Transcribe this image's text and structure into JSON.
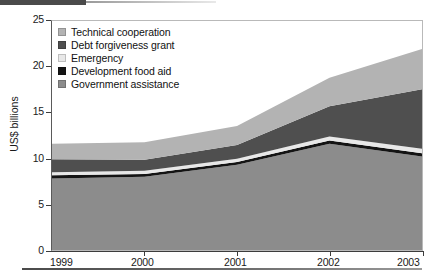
{
  "figure": {
    "top_rule": "decorative-rule",
    "bottom_rule": "decorative-rule"
  },
  "chart_data": {
    "type": "area",
    "stacked": true,
    "title": "",
    "xlabel": "",
    "ylabel": "US$ billions",
    "x": [
      "1999",
      "2000",
      "2001",
      "2002",
      "2003"
    ],
    "categories": [
      "1999",
      "2000",
      "2001",
      "2002",
      "2003"
    ],
    "xtick_labels": [
      "1999",
      "2000",
      "2001",
      "2002",
      "2003"
    ],
    "ytick_labels": [
      "0",
      "5",
      "10",
      "15",
      "20",
      "25"
    ],
    "ytick_values": [
      0,
      5,
      10,
      15,
      20,
      25
    ],
    "ylim": [
      0,
      25
    ],
    "grid": false,
    "legend_position": "top-left",
    "stack_order_bottom_to_top": [
      "Government assistance",
      "Development food aid",
      "Emergency",
      "Debt forgiveness grant",
      "Technical cooperation"
    ],
    "series": [
      {
        "name": "Government assistance",
        "color": "#8c8c8c",
        "values": [
          7.8,
          8.0,
          9.3,
          11.6,
          10.2
        ]
      },
      {
        "name": "Development food aid",
        "color": "#141414",
        "values": [
          0.35,
          0.3,
          0.3,
          0.35,
          0.35
        ]
      },
      {
        "name": "Emergency",
        "color": "#e8e8e8",
        "values": [
          0.35,
          0.35,
          0.35,
          0.45,
          0.5
        ]
      },
      {
        "name": "Debt forgiveness grant",
        "color": "#4f4f4f",
        "values": [
          1.4,
          1.2,
          1.5,
          3.3,
          6.5
        ]
      },
      {
        "name": "Technical cooperation",
        "color": "#b3b3b3",
        "values": [
          1.7,
          1.9,
          2.1,
          3.1,
          4.4
        ]
      }
    ],
    "totals": [
      11.6,
      11.75,
      13.55,
      18.8,
      21.95
    ]
  },
  "legend": {
    "items": [
      {
        "label": "Technical cooperation",
        "color": "#b3b3b3"
      },
      {
        "label": "Debt forgiveness grant",
        "color": "#4f4f4f"
      },
      {
        "label": "Emergency",
        "color": "#e8e8e8"
      },
      {
        "label": "Development food aid",
        "color": "#141414"
      },
      {
        "label": "Government assistance",
        "color": "#8c8c8c"
      }
    ]
  },
  "axes": {
    "y_title": "US$ billions"
  }
}
